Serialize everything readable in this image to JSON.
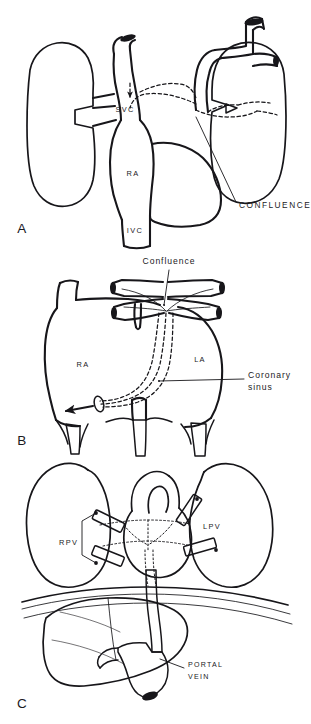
{
  "figure": {
    "ink_color": "#17161a",
    "background_color": "#ffffff",
    "panel_count": 3
  },
  "panels": [
    {
      "id": "panel-a",
      "letter": "A",
      "letter_x": 22,
      "letter_y": 229,
      "subtitle": "supracardiac type",
      "labels": [
        {
          "name": "svc-label",
          "text": "SVC",
          "x": 125,
          "y": 110,
          "style": "anat",
          "anchor": "middle"
        },
        {
          "name": "ra-label",
          "text": "RA",
          "x": 133,
          "y": 174,
          "style": "anat",
          "anchor": "middle"
        },
        {
          "name": "ivc-label",
          "text": "IVC",
          "x": 135,
          "y": 231,
          "style": "anat",
          "anchor": "middle"
        },
        {
          "name": "confluence-label",
          "text": "CONFLUENCE",
          "x": 239,
          "y": 206,
          "style": "caps",
          "anchor": "start"
        }
      ]
    },
    {
      "id": "panel-b",
      "letter": "B",
      "letter_x": 22,
      "letter_y": 441,
      "subtitle": "cardiac type, coronary sinus",
      "labels": [
        {
          "name": "confluence-label",
          "text": "Confluence",
          "x": 169,
          "y": 262,
          "style": "script",
          "anchor": "middle"
        },
        {
          "name": "ra-label",
          "text": "RA",
          "x": 83,
          "y": 365,
          "style": "anat",
          "anchor": "middle"
        },
        {
          "name": "la-label",
          "text": "LA",
          "x": 200,
          "y": 360,
          "style": "anat",
          "anchor": "middle"
        },
        {
          "name": "coronary-sinus-label-line1",
          "text": "Coronary",
          "x": 248,
          "y": 376,
          "style": "script",
          "anchor": "start"
        },
        {
          "name": "coronary-sinus-label-line2",
          "text": "sinus",
          "x": 248,
          "y": 388,
          "style": "script",
          "anchor": "start"
        }
      ]
    },
    {
      "id": "panel-c",
      "letter": "C",
      "letter_x": 22,
      "letter_y": 704,
      "subtitle": "infracardiac type, portal vein",
      "labels": [
        {
          "name": "rpv-label",
          "text": "RPV",
          "x": 59,
          "y": 543,
          "style": "anat",
          "anchor": "start"
        },
        {
          "name": "lpv-label",
          "text": "LPV",
          "x": 203,
          "y": 527,
          "style": "anat",
          "anchor": "start"
        },
        {
          "name": "portal-vein-label-line1",
          "text": "PORTAL",
          "x": 188,
          "y": 665,
          "style": "caps-sm",
          "anchor": "start"
        },
        {
          "name": "portal-vein-label-line2",
          "text": "VEIN",
          "x": 188,
          "y": 677,
          "style": "caps-sm",
          "anchor": "start"
        }
      ]
    }
  ]
}
